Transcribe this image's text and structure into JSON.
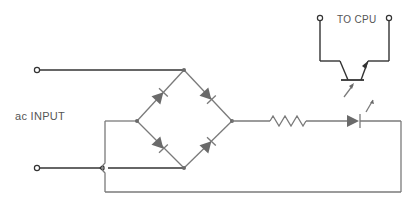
{
  "labels": {
    "input": "ac INPUT",
    "output": "TO CPU"
  },
  "components": {
    "bridge_rectifier": {
      "type": "full-wave diode bridge",
      "diode_count": 4
    },
    "resistor": {
      "type": "current-limiting resistor"
    },
    "led": {
      "type": "light-emitting diode"
    },
    "phototransistor": {
      "type": "NPN phototransistor",
      "optically_coupled_to": "led"
    },
    "terminals": [
      "ac-input-top",
      "ac-input-bottom",
      "cpu-out-left",
      "cpu-out-right"
    ]
  },
  "colors": {
    "wire_dark": "#333333",
    "wire_gray": "#7a7a7a",
    "component_fill": "#6a6a6a",
    "background": "#ffffff"
  }
}
